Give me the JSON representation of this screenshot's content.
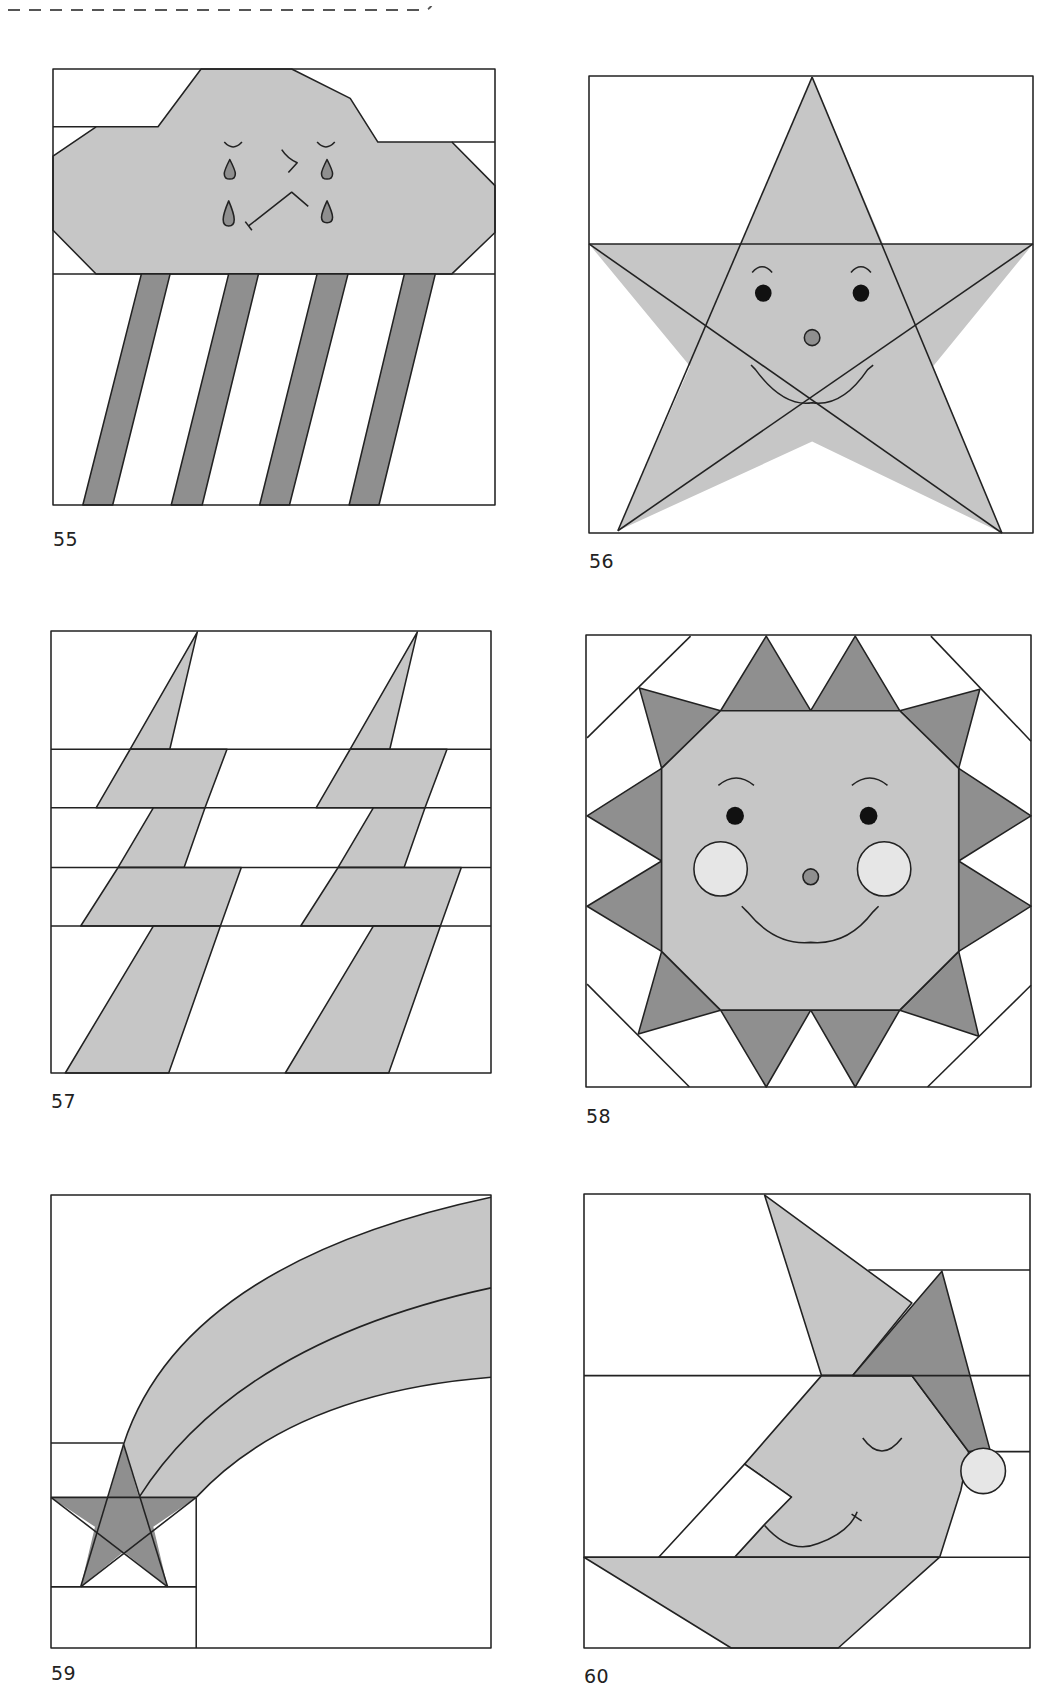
{
  "page": {
    "type": "quilt block pattern sheet",
    "colors": {
      "light_fabric": "#c6c6c6",
      "dark_fabric": "#8f8f8f",
      "accent_light": "#e6e6e6",
      "background": "#ffffff",
      "outline": "#222222"
    }
  },
  "blocks": [
    {
      "number": "55",
      "subject": "crying rain cloud"
    },
    {
      "number": "56",
      "subject": "smiling star"
    },
    {
      "number": "57",
      "subject": "lightning bolts"
    },
    {
      "number": "58",
      "subject": "smiling sun"
    },
    {
      "number": "59",
      "subject": "shooting star"
    },
    {
      "number": "60",
      "subject": "sleeping moon with nightcap"
    }
  ]
}
